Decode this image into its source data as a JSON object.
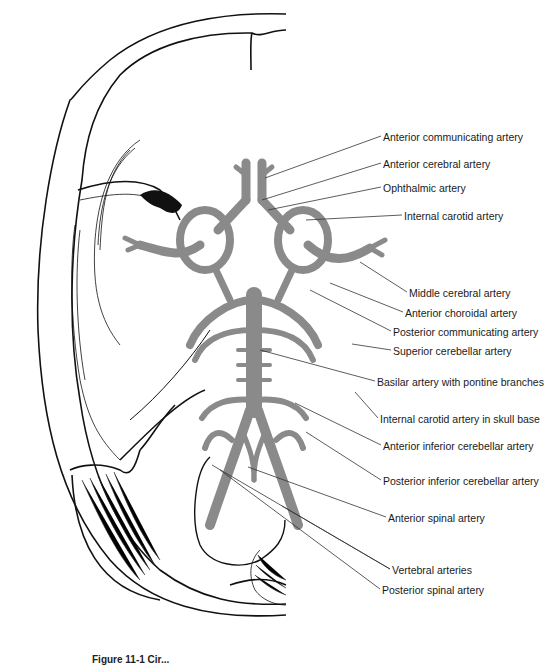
{
  "figure": {
    "artery_color": "#8a8a8a",
    "line_color": "#111111",
    "leader_color": "#333333",
    "caption_partial": "Figure 11-1 Cir..."
  },
  "labels": [
    {
      "id": "aca-comm",
      "text": "Anterior communicating artery",
      "x": 383,
      "y": 131,
      "target": [
        265,
        178
      ]
    },
    {
      "id": "aca",
      "text": "Anterior cerebral artery",
      "x": 383,
      "y": 158,
      "target": [
        262,
        200
      ]
    },
    {
      "id": "ophthalmic",
      "text": "Ophthalmic artery",
      "x": 383,
      "y": 182,
      "target": [
        268,
        210
      ]
    },
    {
      "id": "ica",
      "text": "Internal carotid artery",
      "x": 404,
      "y": 210,
      "target": [
        306,
        220
      ]
    },
    {
      "id": "mca",
      "text": "Middle cerebral artery",
      "x": 409,
      "y": 287,
      "target": [
        360,
        262
      ]
    },
    {
      "id": "ant-choroidal",
      "text": "Anterior choroidal artery",
      "x": 405,
      "y": 307,
      "target": [
        330,
        283
      ]
    },
    {
      "id": "pcomm",
      "text": "Posterior communicating artery",
      "x": 393,
      "y": 326,
      "target": [
        310,
        290
      ]
    },
    {
      "id": "sca",
      "text": "Superior cerebellar artery",
      "x": 393,
      "y": 345,
      "target": [
        352,
        344
      ]
    },
    {
      "id": "basilar",
      "text": "Basilar artery with pontine branches",
      "x": 377,
      "y": 376,
      "target": [
        260,
        350
      ]
    },
    {
      "id": "ica-skull",
      "text": "Internal carotid artery in skull base",
      "x": 380,
      "y": 413,
      "target": [
        355,
        392
      ]
    },
    {
      "id": "aica",
      "text": "Anterior inferior cerebellar artery",
      "x": 383,
      "y": 440,
      "target": [
        295,
        403
      ]
    },
    {
      "id": "pica",
      "text": "Posterior inferior cerebellar artery",
      "x": 383,
      "y": 475,
      "target": [
        306,
        432
      ]
    },
    {
      "id": "ant-spinal",
      "text": "Anterior spinal artery",
      "x": 388,
      "y": 512,
      "target": [
        248,
        467
      ]
    },
    {
      "id": "vertebral",
      "text": "Vertebral arteries",
      "x": 392,
      "y": 564,
      "targets": [
        [
          212,
          465
        ],
        [
          282,
          506
        ]
      ]
    },
    {
      "id": "post-spinal",
      "text": "Posterior spinal artery",
      "x": 382,
      "y": 584,
      "target": [
        220,
        470
      ]
    }
  ]
}
